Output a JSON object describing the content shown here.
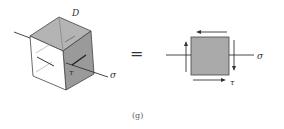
{
  "figure": {
    "caption": "(g)",
    "equals_sign": "=",
    "cube": {
      "label_top": "D",
      "label_tau": "τ",
      "label_sigma": "σ"
    },
    "element": {
      "label_sigma": "σ",
      "label_tau": "τ"
    },
    "colors": {
      "shaded_face": "#9a9a9a",
      "top_face": "#b4b4b4",
      "front_face": "#ffffff",
      "square_fill": "#aaaaaa",
      "stroke": "#333333"
    }
  }
}
